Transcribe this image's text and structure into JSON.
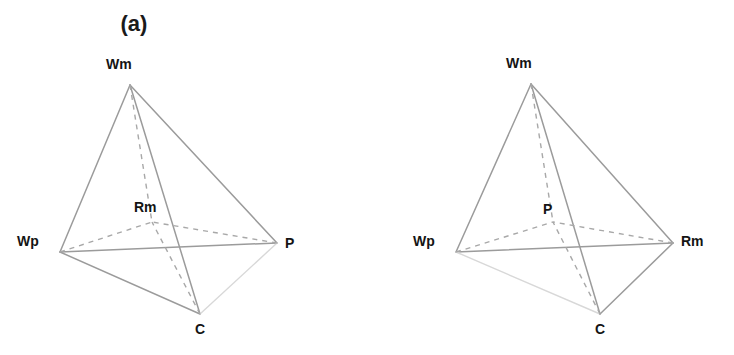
{
  "figure": {
    "background_color": "#ffffff",
    "line_color": "#9b9b9b",
    "dashed_line_color": "#a8a8a8",
    "faint_line_color": "#d8d8d8",
    "label_color": "#141414"
  },
  "panels": [
    {
      "id": "a",
      "title": "(a)",
      "vertices": [
        {
          "key": "Wm",
          "label": "Wm",
          "x": 130,
          "y": 85,
          "hidden": false,
          "label_x": 106,
          "label_y": 57
        },
        {
          "key": "Wp",
          "label": "Wp",
          "x": 60,
          "y": 252,
          "hidden": false,
          "label_x": 17,
          "label_y": 234
        },
        {
          "key": "P",
          "label": "P",
          "x": 277,
          "y": 243,
          "hidden": false,
          "label_x": 285,
          "label_y": 236
        },
        {
          "key": "C",
          "label": "C",
          "x": 200,
          "y": 314,
          "hidden": false,
          "label_x": 195,
          "label_y": 322
        },
        {
          "key": "Rm",
          "label": "Rm",
          "x": 152,
          "y": 222,
          "hidden": true,
          "label_x": 134,
          "label_y": 200
        }
      ],
      "edges": [
        {
          "from": "Wm",
          "to": "Wp",
          "style": "solid"
        },
        {
          "from": "Wm",
          "to": "P",
          "style": "solid"
        },
        {
          "from": "Wm",
          "to": "C",
          "style": "solid"
        },
        {
          "from": "Wp",
          "to": "P",
          "style": "solid"
        },
        {
          "from": "Wp",
          "to": "C",
          "style": "solid"
        },
        {
          "from": "P",
          "to": "C",
          "style": "faint"
        },
        {
          "from": "Wm",
          "to": "Rm",
          "style": "dashed"
        },
        {
          "from": "Wp",
          "to": "Rm",
          "style": "dashed"
        },
        {
          "from": "P",
          "to": "Rm",
          "style": "dashed"
        },
        {
          "from": "C",
          "to": "Rm",
          "style": "dashed"
        }
      ]
    },
    {
      "id": "b",
      "title": "(b)",
      "vertices": [
        {
          "key": "Wm",
          "label": "Wm",
          "x": 531,
          "y": 84,
          "hidden": false,
          "label_x": 506,
          "label_y": 56
        },
        {
          "key": "Wp",
          "label": "Wp",
          "x": 456,
          "y": 252,
          "hidden": false,
          "label_x": 413,
          "label_y": 234
        },
        {
          "key": "Rm",
          "label": "Rm",
          "x": 673,
          "y": 243,
          "hidden": false,
          "label_x": 681,
          "label_y": 234
        },
        {
          "key": "C",
          "label": "C",
          "x": 600,
          "y": 314,
          "hidden": false,
          "label_x": 595,
          "label_y": 322
        },
        {
          "key": "P",
          "label": "P",
          "x": 553,
          "y": 222,
          "hidden": true,
          "label_x": 543,
          "label_y": 202
        }
      ],
      "edges": [
        {
          "from": "Wm",
          "to": "Wp",
          "style": "solid"
        },
        {
          "from": "Wm",
          "to": "Rm",
          "style": "solid"
        },
        {
          "from": "Wm",
          "to": "C",
          "style": "solid"
        },
        {
          "from": "Wp",
          "to": "Rm",
          "style": "solid"
        },
        {
          "from": "Wp",
          "to": "C",
          "style": "faint"
        },
        {
          "from": "Rm",
          "to": "C",
          "style": "solid"
        },
        {
          "from": "Wm",
          "to": "P",
          "style": "dashed"
        },
        {
          "from": "Wp",
          "to": "P",
          "style": "dashed"
        },
        {
          "from": "Rm",
          "to": "P",
          "style": "dashed"
        },
        {
          "from": "C",
          "to": "P",
          "style": "dashed"
        }
      ]
    }
  ]
}
